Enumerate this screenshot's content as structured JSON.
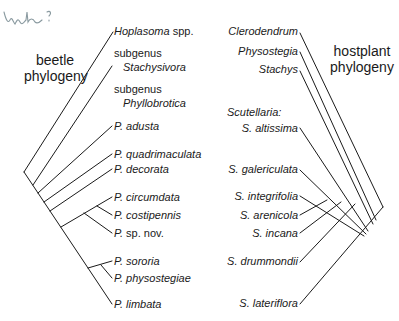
{
  "annotation": {
    "handwritten": "mh?"
  },
  "beetle": {
    "title_line1": "beetle",
    "title_line2": "phylogeny",
    "taxa": [
      {
        "name": "Hoplasoma",
        "suffix": " spp.",
        "italic": true
      },
      {
        "prefix": "subgenus",
        "name": "Stachysivora",
        "italic": true
      },
      {
        "prefix": "subgenus",
        "name": "Phyllobrotica",
        "italic": true
      },
      {
        "name": "P. adusta",
        "italic": true
      },
      {
        "name": "P. quadrimaculata",
        "italic": true
      },
      {
        "name": "P. decorata",
        "italic": true
      },
      {
        "name": "P. circumdata",
        "italic": true
      },
      {
        "name": "P. costipennis",
        "italic": true
      },
      {
        "name": "P.",
        "suffix": " sp. nov.",
        "italic": true
      },
      {
        "name": "P. sororia",
        "italic": true
      },
      {
        "name": "P. physostegiae",
        "italic": true
      },
      {
        "name": "P. limbata",
        "italic": true
      }
    ]
  },
  "hostplant": {
    "title_line1": "hostplant",
    "title_line2": "phylogeny",
    "taxa": [
      {
        "name": "Clerodendrum"
      },
      {
        "name": "Physostegia"
      },
      {
        "name": "Stachys"
      },
      {
        "prefix": "Scutellaria:",
        "name": "S. altissima"
      },
      {
        "name": "S. galericulata"
      },
      {
        "name": "S. integrifolia"
      },
      {
        "name": "S. arenicola"
      },
      {
        "name": "S. incana"
      },
      {
        "name": "S. drummondii"
      },
      {
        "name": "S. lateriflora"
      }
    ]
  },
  "colors": {
    "line": "#1a1a1a",
    "handwriting": "#8a9aa0",
    "background": "#ffffff"
  }
}
